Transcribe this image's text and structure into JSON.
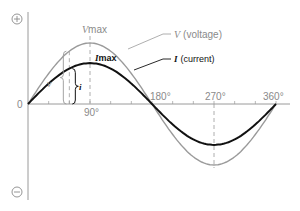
{
  "diagram": {
    "type": "ac-waveform",
    "axis": {
      "positive_symbol": "+",
      "negative_symbol": "−",
      "origin_label": "0",
      "x_ticks_degrees": [
        90,
        180,
        270,
        360
      ],
      "x_tick_labels": [
        "90°",
        "180°",
        "270°",
        "360°"
      ]
    },
    "series": [
      {
        "name": "voltage",
        "symbol": "V",
        "label_suffix": "(voltage)",
        "color": "#9a9a9a",
        "relative_amplitude": 1.0,
        "phase_degrees": 0
      },
      {
        "name": "current",
        "symbol": "I",
        "label_suffix": "(current)",
        "color": "#111111",
        "relative_amplitude": 0.67,
        "phase_degrees": 0
      }
    ],
    "labels": {
      "vmax_symbol": "V",
      "vmax_sub": "max",
      "imax_symbol": "I",
      "imax_sub": "max",
      "instant_v": "v",
      "instant_i": "i"
    },
    "instant_marker_degrees": 60
  }
}
